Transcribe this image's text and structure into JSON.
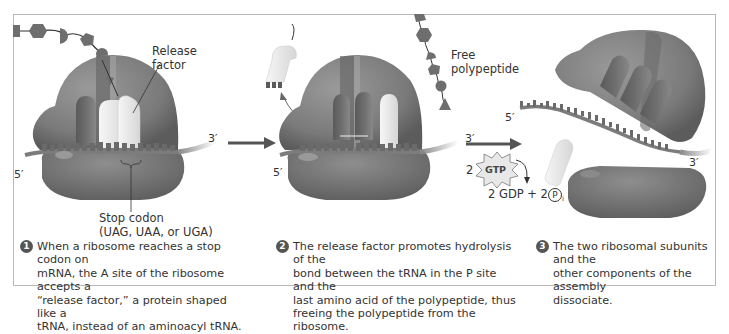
{
  "panel1": {
    "labels": {
      "release_factor": "Release\nfactor",
      "stop_codon": "Stop codon",
      "stop_codon_list": "(UAG, UAA, or UGA)",
      "five_prime": "5′",
      "three_prime": "3′"
    },
    "step_number": "1",
    "caption": "When a ribosome reaches a stop codon on\nmRNA, the A site of the ribosome accepts a\n“release factor,” a protein shaped like a\ntRNA, instead of an aminoacyl tRNA."
  },
  "panel2": {
    "labels": {
      "free_polypeptide": "Free\npolypeptide",
      "five_prime": "5′",
      "three_prime": "3′"
    },
    "step_number": "2",
    "caption": "The release factor promotes hydrolysis of the\nbond between the tRNA in the P site and the\nlast amino acid of the polypeptide, thus\nfreeing the polypeptide from the ribosome."
  },
  "panel3": {
    "labels": {
      "five_prime": "5′",
      "three_prime": "3′",
      "gtp_coefficient": "2",
      "gtp": "GTP",
      "products_prefix": "2 GDP + 2",
      "phosphate": "P",
      "phosphate_sub": "i"
    },
    "step_number": "3",
    "caption": "The two ribosomal subunits and the\nother components of the assembly\ndissociate."
  },
  "colors": {
    "ribosome": "#7a7a7a",
    "ribosome_dark": "#5a5a5a",
    "trna": "#ececec",
    "mrna": "#8a8a8a",
    "amino_acid": "#6e6e6e",
    "arrow": "#555555",
    "frame": "#b8b8b8"
  }
}
